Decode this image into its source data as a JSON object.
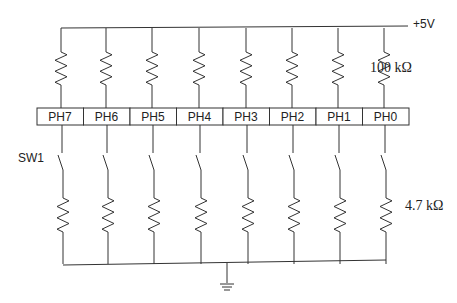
{
  "diagram": {
    "supply_label": "+5V",
    "pullup_value": "100 kΩ",
    "pulldown_value": "4.7 kΩ",
    "switch_label": "SW1",
    "ports": [
      "PH7",
      "PH6",
      "PH5",
      "PH4",
      "PH3",
      "PH2",
      "PH1",
      "PH0"
    ],
    "ground": "ground-symbol",
    "line_color": "#333333"
  }
}
